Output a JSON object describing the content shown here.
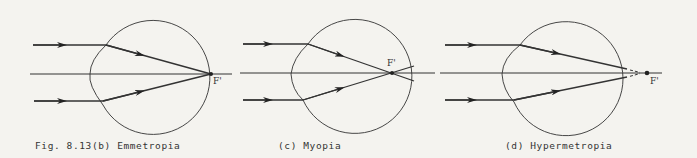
{
  "figure": {
    "panels": [
      {
        "id": "b",
        "caption": "Fig. 8.13(b) Emmetropia",
        "focal_label": "F'",
        "condition": "Emmetropia",
        "focus_position": "on retina"
      },
      {
        "id": "c",
        "caption": "(c) Myopia",
        "focal_label": "F'",
        "condition": "Myopia",
        "focus_position": "in front of retina"
      },
      {
        "id": "d",
        "caption": "(d) Hypermetropia",
        "focal_label": "F'",
        "condition": "Hypermetropia",
        "focus_position": "behind retina"
      }
    ],
    "colors": {
      "line": "#2a2a2a",
      "background": "#f4f3ef"
    }
  }
}
